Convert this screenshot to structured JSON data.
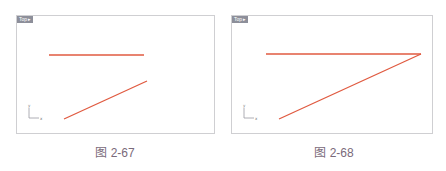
{
  "figures": [
    {
      "caption": "图 2-67",
      "viewport_label": "Top ▸",
      "axis": {
        "y_label": "y",
        "x_label": "x"
      },
      "line_color": "#e05a40",
      "lines": [
        {
          "name": "horizontal-line",
          "x1": 32,
          "y1": 39,
          "x2": 127,
          "y2": 39
        },
        {
          "name": "diagonal-line",
          "x1": 47,
          "y1": 103,
          "x2": 130,
          "y2": 65
        }
      ]
    },
    {
      "caption": "图 2-68",
      "viewport_label": "Top ▸",
      "axis": {
        "y_label": "y",
        "x_label": "x"
      },
      "line_color": "#e05a40",
      "lines": [
        {
          "name": "horizontal-line",
          "x1": 34,
          "y1": 38,
          "x2": 189,
          "y2": 38
        },
        {
          "name": "diagonal-line",
          "x1": 47,
          "y1": 103,
          "x2": 189,
          "y2": 38
        }
      ]
    }
  ]
}
